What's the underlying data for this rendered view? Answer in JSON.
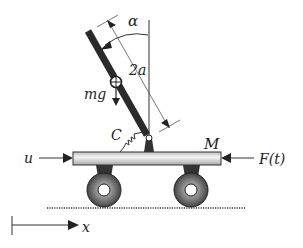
{
  "diagram": {
    "labels": {
      "angle": "α",
      "length": "2a",
      "weight": "mg",
      "damper": "C",
      "cart_mass": "M",
      "control_input": "u",
      "disturbance": "F(t)",
      "position_axis": "x"
    },
    "colors": {
      "rod": "#2a2a2a",
      "cart_bar_fill": "#e6e6e6",
      "wheel_outer": "#555555",
      "wheel_inner": "#ffffff",
      "line": "#333333"
    }
  }
}
